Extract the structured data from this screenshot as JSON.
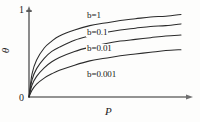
{
  "chart_data": {
    "type": "line",
    "title": "",
    "xlabel": "P",
    "ylabel": "θ",
    "xlim": [
      0,
      1
    ],
    "ylim": [
      0,
      1
    ],
    "grid": false,
    "legend_position": "inline-on-curves",
    "y_ticks": [
      "0",
      "1"
    ],
    "x_ticks": [
      "0"
    ],
    "origin_label": "0",
    "series": [
      {
        "name": "b=1",
        "label": "b=1",
        "b": 1,
        "x": [
          0.0,
          0.02,
          0.05,
          0.1,
          0.15,
          0.2,
          0.3,
          0.4,
          0.5,
          0.6,
          0.7,
          0.8,
          0.9,
          1.0
        ],
        "y": [
          0.0,
          0.27,
          0.43,
          0.57,
          0.65,
          0.71,
          0.78,
          0.83,
          0.86,
          0.89,
          0.91,
          0.93,
          0.94,
          0.96
        ]
      },
      {
        "name": "b=0.1",
        "label": "b=0.1",
        "b": 0.1,
        "x": [
          0.0,
          0.02,
          0.05,
          0.1,
          0.15,
          0.2,
          0.3,
          0.4,
          0.5,
          0.6,
          0.7,
          0.8,
          0.9,
          1.0
        ],
        "y": [
          0.0,
          0.2,
          0.33,
          0.45,
          0.53,
          0.58,
          0.66,
          0.71,
          0.75,
          0.78,
          0.8,
          0.82,
          0.83,
          0.85
        ]
      },
      {
        "name": "b=0.01",
        "label": "b=0.01",
        "b": 0.01,
        "x": [
          0.0,
          0.02,
          0.05,
          0.1,
          0.15,
          0.2,
          0.3,
          0.4,
          0.5,
          0.6,
          0.7,
          0.8,
          0.9,
          1.0
        ],
        "y": [
          0.0,
          0.14,
          0.24,
          0.34,
          0.41,
          0.46,
          0.53,
          0.58,
          0.62,
          0.65,
          0.67,
          0.69,
          0.71,
          0.72
        ]
      },
      {
        "name": "b=0.001",
        "label": "b=0.001",
        "b": 0.001,
        "x": [
          0.0,
          0.02,
          0.05,
          0.1,
          0.15,
          0.2,
          0.3,
          0.4,
          0.5,
          0.6,
          0.7,
          0.8,
          0.9,
          1.0
        ],
        "y": [
          0.0,
          0.08,
          0.15,
          0.22,
          0.27,
          0.31,
          0.37,
          0.42,
          0.45,
          0.48,
          0.5,
          0.52,
          0.54,
          0.55
        ]
      }
    ]
  },
  "axes": {
    "y_top_label": "1",
    "y_axis_title": "θ",
    "x_axis_title": "P",
    "origin": "0"
  },
  "labels": {
    "curve_0": "b=1",
    "curve_1": "b=0.1",
    "curve_2": "b=0.01",
    "curve_3": "b=0.001"
  },
  "colors": {
    "background": "#fdfdfc",
    "axis": "#6f6f6f",
    "curve": "#2b2b2b",
    "text": "#1d1d1d"
  }
}
